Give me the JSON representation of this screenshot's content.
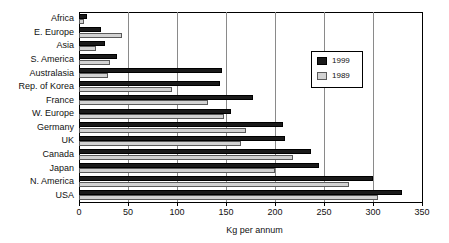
{
  "chart_data": {
    "type": "bar",
    "orientation": "horizontal",
    "title": "",
    "xlabel": "Kg per annum",
    "ylabel": "",
    "xlim": [
      0,
      350
    ],
    "xticks": [
      0,
      50,
      100,
      150,
      200,
      250,
      300,
      350
    ],
    "grid": true,
    "grid_axis": "x",
    "legend_position": "upper right",
    "categories": [
      "Africa",
      "E. Europe",
      "Asia",
      "S. America",
      "Australasia",
      "Rep. of Korea",
      "France",
      "W. Europe",
      "Germany",
      "UK",
      "Canada",
      "Japan",
      "N. America",
      "USA"
    ],
    "series": [
      {
        "name": "1999",
        "color": "#1a1a1a",
        "values": [
          8,
          22,
          27,
          39,
          146,
          144,
          178,
          155,
          208,
          210,
          237,
          245,
          300,
          330
        ]
      },
      {
        "name": "1989",
        "color": "#d2d2d2",
        "values": [
          5,
          44,
          17,
          32,
          30,
          95,
          132,
          148,
          170,
          165,
          218,
          200,
          275,
          305
        ]
      }
    ]
  },
  "legend": {
    "entries": [
      {
        "label": "1999",
        "swatch": "dark-swatch"
      },
      {
        "label": "1989",
        "swatch": "light-swatch"
      }
    ]
  },
  "axis": {
    "x_title": "Kg per annum",
    "tick_labels": [
      "0",
      "50",
      "100",
      "150",
      "200",
      "250",
      "300",
      "350"
    ]
  }
}
